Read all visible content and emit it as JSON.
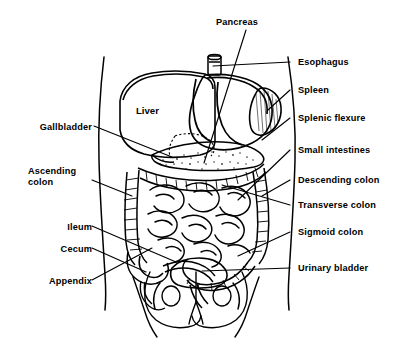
{
  "diagram": {
    "style": "black-and-white line drawing",
    "ink_color": "#000000",
    "background_color": "#ffffff"
  },
  "organ_labels": [
    {
      "id": "liver",
      "text": "Liver"
    }
  ],
  "labels_top": [
    {
      "id": "pancreas",
      "text": "Pancreas",
      "align": "center"
    }
  ],
  "labels_right": [
    {
      "id": "esophagus",
      "text": "Esophagus"
    },
    {
      "id": "spleen",
      "text": "Spleen"
    },
    {
      "id": "splenic-flexure",
      "text": "Splenic flexure"
    },
    {
      "id": "small-intestines",
      "text": "Small intestines"
    },
    {
      "id": "descending-colon",
      "text": "Descending colon"
    },
    {
      "id": "transverse-colon",
      "text": "Transverse colon"
    },
    {
      "id": "sigmoid-colon",
      "text": "Sigmoid colon"
    },
    {
      "id": "urinary-bladder",
      "text": "Urinary bladder"
    }
  ],
  "labels_left": [
    {
      "id": "gallbladder",
      "text": "Gallbladder"
    },
    {
      "id": "ascending-colon",
      "line1": "Ascending",
      "line2": "colon"
    },
    {
      "id": "ileum",
      "text": "Ileum"
    },
    {
      "id": "cecum",
      "text": "Cecum"
    },
    {
      "id": "appendix",
      "text": "Appendix"
    }
  ]
}
